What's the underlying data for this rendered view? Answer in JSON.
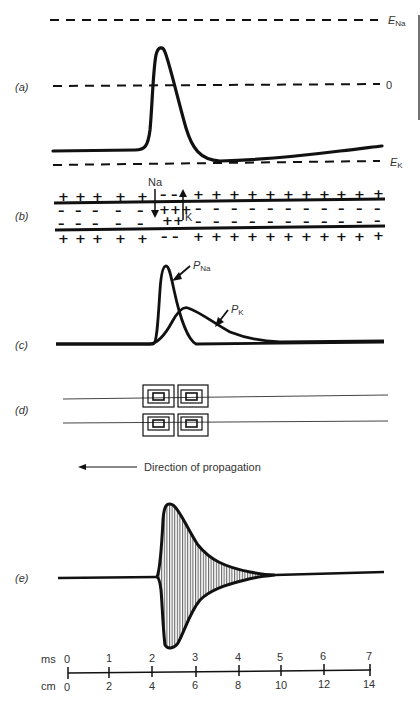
{
  "figure": {
    "panels": {
      "a": {
        "label": "(a)",
        "lines": {
          "e_na": {
            "symbol": "E",
            "subscript": "Na"
          },
          "zero": {
            "text": "0"
          },
          "e_k": {
            "symbol": "E",
            "subscript": "K"
          }
        }
      },
      "b": {
        "label": "(b)",
        "ion_na": "Na",
        "ion_k": "K"
      },
      "c": {
        "label": "(c)",
        "curve_na": {
          "symbol": "P",
          "subscript": "Na"
        },
        "curve_k": {
          "symbol": "P",
          "subscript": "K"
        }
      },
      "d": {
        "label": "(d)",
        "direction_text": "Direction of propagation"
      },
      "e": {
        "label": "(e)"
      }
    },
    "scale": {
      "ms_label": "ms",
      "cm_label": "cm",
      "ms_ticks": [
        "0",
        "1",
        "2",
        "3",
        "4",
        "5",
        "6",
        "7"
      ],
      "cm_ticks": [
        "0",
        "2",
        "4",
        "6",
        "8",
        "10",
        "12",
        "14"
      ]
    }
  }
}
